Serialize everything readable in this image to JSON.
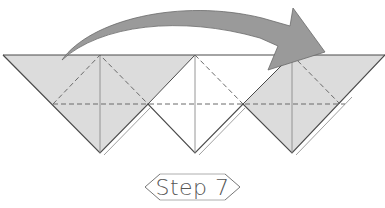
{
  "diagram": {
    "step_label": "Step 7",
    "colors": {
      "paper_shaded": "#dcdcdc",
      "paper_white": "#ffffff",
      "outline": "#4a4a4a",
      "crease": "#8a8a8a",
      "dashed_fold": "#6a6a6a",
      "arrow_fill": "#9a9a9a",
      "arrow_stroke": "#6a6a6a",
      "label_text": "#555555"
    },
    "elements": [
      {
        "name": "left-shaded-flap",
        "shape": "triangle"
      },
      {
        "name": "middle-white-flap",
        "shape": "triangle"
      },
      {
        "name": "right-shaded-flap",
        "shape": "triangle"
      },
      {
        "name": "valley-fold-lines",
        "style": "dashed"
      },
      {
        "name": "fold-over-arrow",
        "direction": "left-to-right"
      }
    ]
  }
}
